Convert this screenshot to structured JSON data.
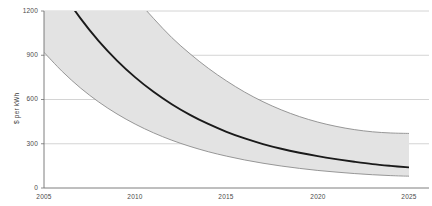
{
  "chart_data": {
    "type": "area",
    "title": "",
    "subtitle": "",
    "xlabel": "",
    "ylabel": "$ per kWh",
    "xlim": [
      2005,
      2025
    ],
    "ylim": [
      0,
      1200
    ],
    "grid": true,
    "legend": "none",
    "x_ticks": [
      "2005",
      "2010",
      "2015",
      "2020",
      "2025"
    ],
    "y_ticks": [
      "0",
      "300",
      "600",
      "900",
      "1200"
    ],
    "x": [
      2005,
      2006,
      2007,
      2008,
      2009,
      2010,
      2011,
      2012,
      2013,
      2014,
      2015,
      2016,
      2017,
      2018,
      2019,
      2020,
      2021,
      2022,
      2023,
      2024,
      2025
    ],
    "series": [
      {
        "name": "Upper bound",
        "role": "band-upper",
        "color": "#8c8c8c",
        "values": [
          2320,
          2060,
          1830,
          1630,
          1450,
          1290,
          1150,
          1020,
          910,
          812,
          726,
          650,
          585,
          530,
          484,
          447,
          418,
          396,
          381,
          373,
          370
        ]
      },
      {
        "name": "Central estimate",
        "role": "line",
        "color": "#1a1a1a",
        "values": [
          1540,
          1330,
          1150,
          996,
          864,
          750,
          652,
          568,
          496,
          434,
          381,
          336,
          298,
          266,
          239,
          216,
          196,
          178,
          162,
          150,
          140
        ]
      },
      {
        "name": "Lower bound",
        "role": "band-lower",
        "color": "#8c8c8c",
        "values": [
          920,
          790,
          678,
          583,
          502,
          433,
          374,
          324,
          282,
          246,
          216,
          190,
          168,
          149,
          133,
          119,
          108,
          98,
          90,
          84,
          80
        ]
      }
    ],
    "band_fill_color": "#e3e3e3",
    "gridline_color": "#c9c9c9",
    "axis_color": "#6f6f6f"
  }
}
